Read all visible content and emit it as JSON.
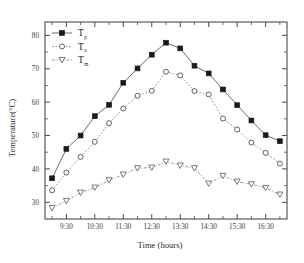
{
  "chart_data": {
    "type": "line",
    "title": "",
    "xlabel": "Time (hours)",
    "ylabel": "Temperature(°C)",
    "x": [
      "9:00",
      "9:30",
      "10:00",
      "10:30",
      "11:00",
      "11:30",
      "12:00",
      "12:30",
      "13:00",
      "13:30",
      "14:00",
      "14:30",
      "15:00",
      "15:30",
      "16:00",
      "16:30",
      "17:00"
    ],
    "xticklabels": [
      "9:30",
      "10:30",
      "11:30",
      "12:30",
      "13:30",
      "14:30",
      "15:30",
      "16:30"
    ],
    "yticklabels": [
      "30",
      "40",
      "50",
      "60",
      "70",
      "80"
    ],
    "ylim": [
      25,
      84
    ],
    "ytick_step": 10,
    "minor_ticks": true,
    "grid": false,
    "legend_position": "top-left",
    "series": [
      {
        "name": "T_p",
        "label_base": "T",
        "label_sub": "p",
        "marker": "filled-square",
        "linestyle": "solid",
        "color": "#1a1a1a",
        "values": [
          37.2,
          46.0,
          50.0,
          55.8,
          59.2,
          65.8,
          70.1,
          74.2,
          77.8,
          76.1,
          70.9,
          68.6,
          63.8,
          59.1,
          54.5,
          50.1,
          48.3
        ]
      },
      {
        "name": "T_a",
        "label_base": "T",
        "label_sub": "a",
        "marker": "open-circle",
        "linestyle": "dotted",
        "color": "#4f4f4f",
        "values": [
          33.6,
          38.9,
          43.6,
          48.1,
          53.7,
          58.1,
          61.9,
          63.4,
          69.1,
          68.0,
          63.3,
          62.3,
          55.1,
          51.8,
          47.9,
          44.8,
          41.6
        ]
      },
      {
        "name": "T_m",
        "label_base": "T",
        "label_sub": "m",
        "marker": "open-triangle-down",
        "linestyle": "dashdot",
        "color": "#6a6a6a",
        "values": [
          28.3,
          30.4,
          32.9,
          34.4,
          36.6,
          38.3,
          40.2,
          40.4,
          42.2,
          41.0,
          40.2,
          35.6,
          37.9,
          36.2,
          35.4,
          34.3,
          32.3
        ]
      }
    ]
  }
}
